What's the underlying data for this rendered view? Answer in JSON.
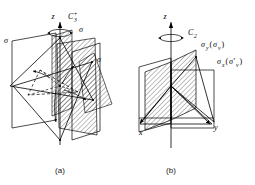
{
  "figure": {
    "background_color": "#ffffff",
    "line_color": "#000000",
    "hatch_color": "#000000",
    "captions": [
      {
        "id": "caption-a",
        "text": "(a)"
      },
      {
        "id": "caption-b",
        "text": "(b)"
      }
    ]
  },
  "panel_a": {
    "caption": "(a)",
    "axis_label": "z",
    "rotation_label": {
      "base": "C",
      "subscript": "3",
      "superscript": "+"
    },
    "plane_labels": [
      {
        "id": "sigma-left",
        "text": "σ"
      },
      {
        "id": "sigma-top-right",
        "text": "σ"
      },
      {
        "id": "sigma-right",
        "text": "σ"
      }
    ],
    "mirror_plane_count": 3,
    "rotation_order": 3,
    "point_group": "C3v"
  },
  "panel_b": {
    "caption": "(b)",
    "axis_labels": {
      "z": "z",
      "x": "x",
      "y": "y"
    },
    "rotation_label": {
      "base": "C",
      "subscript": "2"
    },
    "plane_labels": [
      {
        "id": "sigma-y",
        "base": "σ",
        "base_sub": "y",
        "paren_open": "(",
        "inner": "σ",
        "inner_sub": "v",
        "paren_close": ")",
        "full": "σy(σv)"
      },
      {
        "id": "sigma-x",
        "base": "σ",
        "base_sub": "x",
        "paren_open": "(",
        "inner": "σ′",
        "inner_sub": "v",
        "paren_close": ")",
        "full": "σx(σ′v)"
      }
    ],
    "mirror_plane_count": 2,
    "rotation_order": 2,
    "point_group": "C2v"
  }
}
